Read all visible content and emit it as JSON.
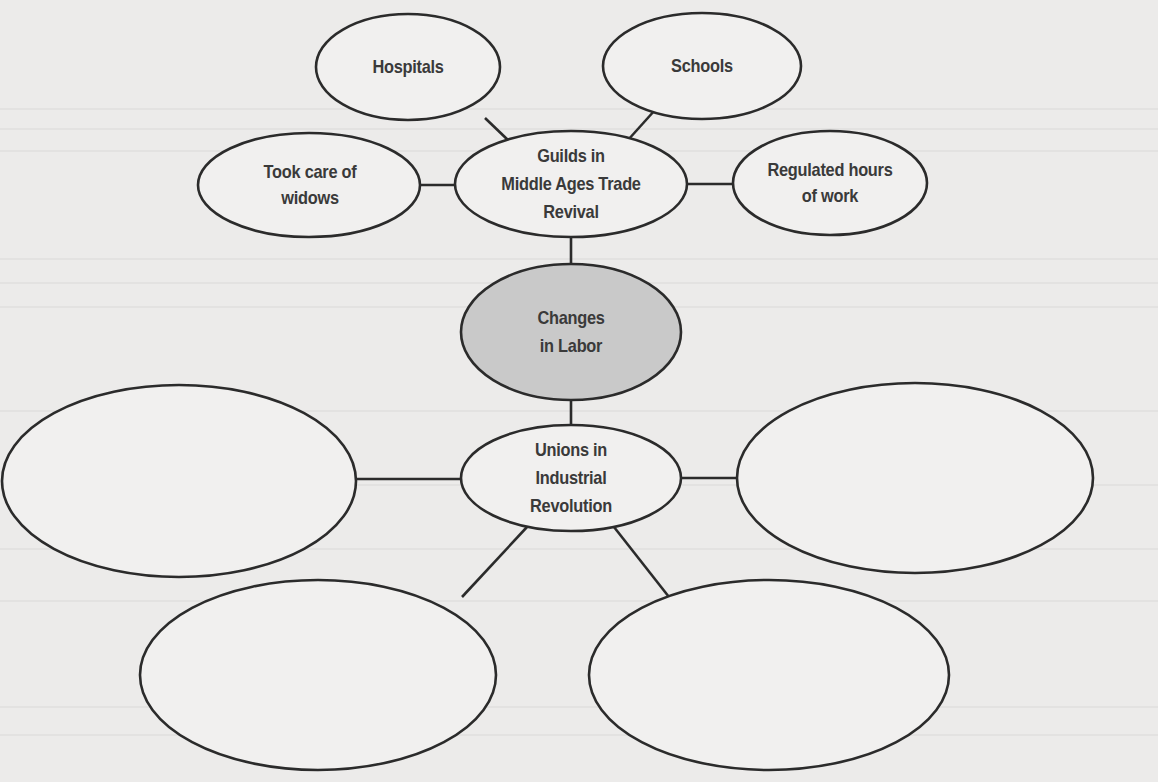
{
  "diagram": {
    "type": "web-organizer",
    "colors": {
      "paper": "#ecebea",
      "stroke": "#2b2b2b",
      "text": "#3a3a3a",
      "center_fill": "#c9c9c9",
      "node_fill": "#f2f2f1"
    },
    "center": {
      "id": "changes-in-labor",
      "label": "Changes\nin Labor",
      "filled": true
    },
    "branches": [
      {
        "id": "guilds",
        "label": "Guilds in\nMiddle Ages Trade\nRevival",
        "details": [
          {
            "id": "hospitals",
            "label": "Hospitals"
          },
          {
            "id": "schools",
            "label": "Schools"
          },
          {
            "id": "widows",
            "label": "Took care of\nwidows"
          },
          {
            "id": "hours",
            "label": "Regulated hours\nof work"
          }
        ]
      },
      {
        "id": "unions",
        "label": "Unions in\nIndustrial\nRevolution",
        "details": [
          {
            "id": "blank-left",
            "label": ""
          },
          {
            "id": "blank-right",
            "label": ""
          },
          {
            "id": "blank-bottom-left",
            "label": ""
          },
          {
            "id": "blank-bottom-right",
            "label": ""
          }
        ]
      }
    ]
  },
  "labels": {
    "hospitals": "Hospitals",
    "schools": "Schools",
    "widows": "Took care of\nwidows",
    "guilds": "Guilds in\nMiddle Ages Trade\nRevival",
    "hours": "Regulated hours\nof work",
    "center": "Changes\nin Labor",
    "unions": "Unions in\nIndustrial\nRevolution"
  }
}
